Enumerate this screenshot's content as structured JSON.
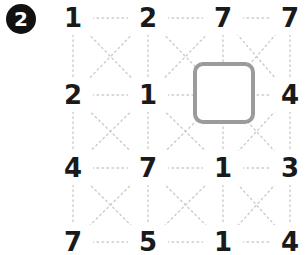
{
  "badge": {
    "label": "2",
    "icon": "filled-circle-number-badge",
    "background_color": "#111111",
    "text_color": "#ffffff"
  },
  "puzzle": {
    "rows": 4,
    "columns": 4,
    "number_color": "#1a1a1a",
    "connector_color": "#cccccc",
    "connector_style": "dotted",
    "grid": [
      [
        "1",
        "2",
        "7",
        "7"
      ],
      [
        "2",
        "1",
        "",
        "4"
      ],
      [
        "4",
        "7",
        "1",
        "3"
      ],
      [
        "7",
        "5",
        "1",
        "4"
      ]
    ],
    "cells": [
      {
        "row": 0,
        "col": 0,
        "value": "1"
      },
      {
        "row": 0,
        "col": 1,
        "value": "2"
      },
      {
        "row": 0,
        "col": 2,
        "value": "7"
      },
      {
        "row": 0,
        "col": 3,
        "value": "7"
      },
      {
        "row": 1,
        "col": 0,
        "value": "2"
      },
      {
        "row": 1,
        "col": 1,
        "value": "1"
      },
      {
        "row": 1,
        "col": 2,
        "value": ""
      },
      {
        "row": 1,
        "col": 3,
        "value": "4"
      },
      {
        "row": 2,
        "col": 0,
        "value": "4"
      },
      {
        "row": 2,
        "col": 1,
        "value": "7"
      },
      {
        "row": 2,
        "col": 2,
        "value": "1"
      },
      {
        "row": 2,
        "col": 3,
        "value": "3"
      },
      {
        "row": 3,
        "col": 0,
        "value": "7"
      },
      {
        "row": 3,
        "col": 1,
        "value": "5"
      },
      {
        "row": 3,
        "col": 2,
        "value": "1"
      },
      {
        "row": 3,
        "col": 3,
        "value": "4"
      }
    ]
  },
  "selection": {
    "row": 1,
    "col": 2,
    "value": "",
    "border_color": "#9b9b9b",
    "fill_color": "#ffffff"
  }
}
